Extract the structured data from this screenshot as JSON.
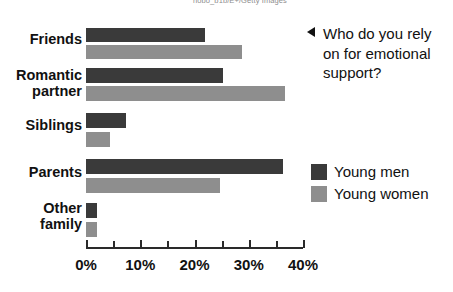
{
  "credit": {
    "text": "nobo_b1b/E+/Getty Images"
  },
  "question": {
    "arrow_icon": "triangle-left-icon",
    "text": "Who do you rely on for emotional support?"
  },
  "legend": {
    "position": "right",
    "entries": [
      {
        "label": "Young men",
        "color": "#3a3a3a",
        "swatch_icon": "legend-swatch-icon"
      },
      {
        "label": "Young women",
        "color": "#8e8e8e",
        "swatch_icon": "legend-swatch-icon"
      }
    ]
  },
  "axis": {
    "tick_labels": [
      "0%",
      "10%",
      "20%",
      "30%",
      "40%"
    ],
    "tick_values": [
      0,
      10,
      20,
      30,
      40
    ],
    "minor_tick_values": [
      5,
      15,
      25,
      35
    ],
    "min": 0,
    "max": 40
  },
  "categories": [
    {
      "label": "Friends",
      "men": 22,
      "women": 28.7
    },
    {
      "label": "Romantic\npartner",
      "men": 25.3,
      "women": 36.6
    },
    {
      "label": "Siblings",
      "men": 7.4,
      "women": 4.4
    },
    {
      "label": "Parents",
      "men": 36.3,
      "women": 24.7
    },
    {
      "label": "Other\nfamily",
      "men": 2.1,
      "women": 2.0
    }
  ],
  "chart_data": {
    "type": "bar",
    "orientation": "horizontal",
    "title": "Who do you rely on for emotional support?",
    "xlabel": "",
    "ylabel": "",
    "xlim": [
      0,
      40
    ],
    "xticks": [
      0,
      5,
      10,
      15,
      20,
      25,
      30,
      35,
      40
    ],
    "xtick_labels": [
      "0%",
      "",
      "10%",
      "",
      "20%",
      "",
      "30%",
      "",
      "40%"
    ],
    "grid": false,
    "legend_position": "right",
    "categories": [
      "Friends",
      "Romantic partner",
      "Siblings",
      "Parents",
      "Other family"
    ],
    "series": [
      {
        "name": "Young men",
        "color": "#3a3a3a",
        "values": [
          22,
          25.3,
          7.4,
          36.3,
          2.1
        ]
      },
      {
        "name": "Young women",
        "color": "#8e8e8e",
        "values": [
          28.7,
          36.6,
          4.4,
          24.7,
          2.0
        ]
      }
    ],
    "units": "percent",
    "annotations": [
      "nobo_b1b/E+/Getty Images"
    ]
  }
}
